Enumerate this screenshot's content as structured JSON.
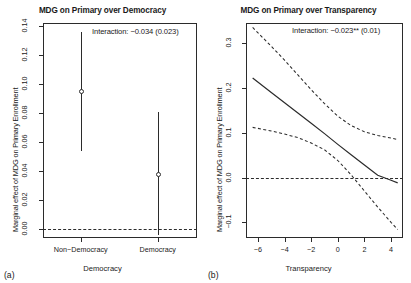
{
  "figure": {
    "panel_a_letter": "(a)",
    "panel_b_letter": "(b)"
  },
  "chart_data": [
    {
      "type": "scatter",
      "panel": "a",
      "title": "MDG on Primary over Democracy",
      "xlabel": "Democracy",
      "ylabel": "Marginal effect of MDG on Primary Enrollment",
      "annotation": "Interaction: −0.034 (0.023)",
      "categories": [
        "Non−Democracy",
        "Democracy"
      ],
      "values": [
        0.095,
        0.0375
      ],
      "ci_low": [
        0.054,
        -0.004
      ],
      "ci_high": [
        0.136,
        0.081
      ],
      "ylim": [
        -0.006,
        0.142
      ],
      "yticks": [
        0.0,
        0.02,
        0.04,
        0.06,
        0.08,
        0.1,
        0.12,
        0.14
      ],
      "ytick_labels": [
        "0.00",
        "0.02",
        "0.04",
        "0.06",
        "0.08",
        "0.10",
        "0.12",
        "0.14"
      ],
      "reference_line": 0.0,
      "grid": false,
      "legend": "none"
    },
    {
      "type": "line",
      "panel": "b",
      "title": "MDG on Primary over Transparency",
      "xlabel": "Transparency",
      "ylabel": "Marginal effect of MDG on Primary Enrollment",
      "annotation": "Interaction: −0.023** (0.01)",
      "xlim": [
        -6.9,
        4.9
      ],
      "ylim": [
        -0.135,
        0.345
      ],
      "xticks": [
        -6,
        -4,
        -2,
        0,
        2,
        4
      ],
      "xtick_labels": [
        "−6",
        "−4",
        "−2",
        "0",
        "2",
        "4"
      ],
      "yticks": [
        -0.1,
        0.0,
        0.1,
        0.2,
        0.3
      ],
      "ytick_labels": [
        "−0.1",
        "0.0",
        "0.1",
        "0.2",
        "0.3"
      ],
      "reference_line": 0.0,
      "grid": false,
      "legend": "none",
      "x": [
        -6.4,
        -5.0,
        -4.0,
        -3.0,
        -2.0,
        -1.0,
        0.0,
        1.0,
        2.0,
        3.0,
        4.0,
        4.5
      ],
      "series": [
        {
          "name": "Marginal effect",
          "style": "solid",
          "values": [
            0.222,
            0.19,
            0.167,
            0.144,
            0.121,
            0.098,
            0.074,
            0.051,
            0.028,
            0.005,
            -0.006,
            -0.012
          ]
        },
        {
          "name": "Upper 95% CI",
          "style": "dashed",
          "values": [
            0.335,
            0.293,
            0.262,
            0.229,
            0.196,
            0.165,
            0.137,
            0.116,
            0.102,
            0.094,
            0.088,
            0.085
          ]
        },
        {
          "name": "Lower 95% CI",
          "style": "dashed",
          "values": [
            0.112,
            0.104,
            0.097,
            0.089,
            0.077,
            0.062,
            0.038,
            0.006,
            -0.03,
            -0.066,
            -0.1,
            -0.116
          ]
        }
      ]
    }
  ]
}
